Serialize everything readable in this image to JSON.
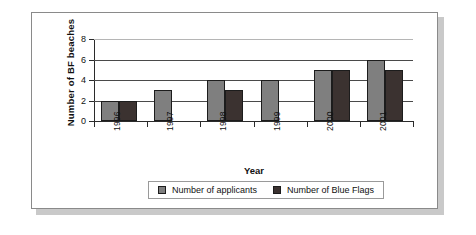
{
  "chart_data": {
    "type": "bar",
    "title": "",
    "xlabel": "Year",
    "ylabel": "Number of BF beaches",
    "categories": [
      "1996",
      "1997",
      "1998",
      "1999",
      "2000",
      "2001"
    ],
    "ylim": [
      0,
      8
    ],
    "yticks": [
      0,
      2,
      4,
      6,
      8
    ],
    "ytick_labels": [
      "0",
      "2",
      "4",
      "6",
      "8"
    ],
    "grid": true,
    "legend_position": "bottom",
    "series": [
      {
        "name": "Number of applicants",
        "color": "#7f7f7f",
        "values": [
          2,
          3,
          4,
          4,
          5,
          6
        ]
      },
      {
        "name": "Number of Blue Flags",
        "color": "#3b3230",
        "values": [
          2,
          0,
          3,
          0,
          5,
          5
        ]
      }
    ]
  },
  "legend": {
    "entries": [
      {
        "label": "Number of applicants",
        "color": "#7f7f7f"
      },
      {
        "label": "Number of Blue Flags",
        "color": "#3b3230"
      }
    ]
  },
  "colors": {
    "applicants": "#7f7f7f",
    "blue_flags": "#3b3230",
    "axis": "#2b2b2b",
    "grid": "#4a4a4a",
    "grid_faint": "#b5b5b5",
    "frame": "#8a8a8a",
    "shadow": "#c9c9c9"
  }
}
